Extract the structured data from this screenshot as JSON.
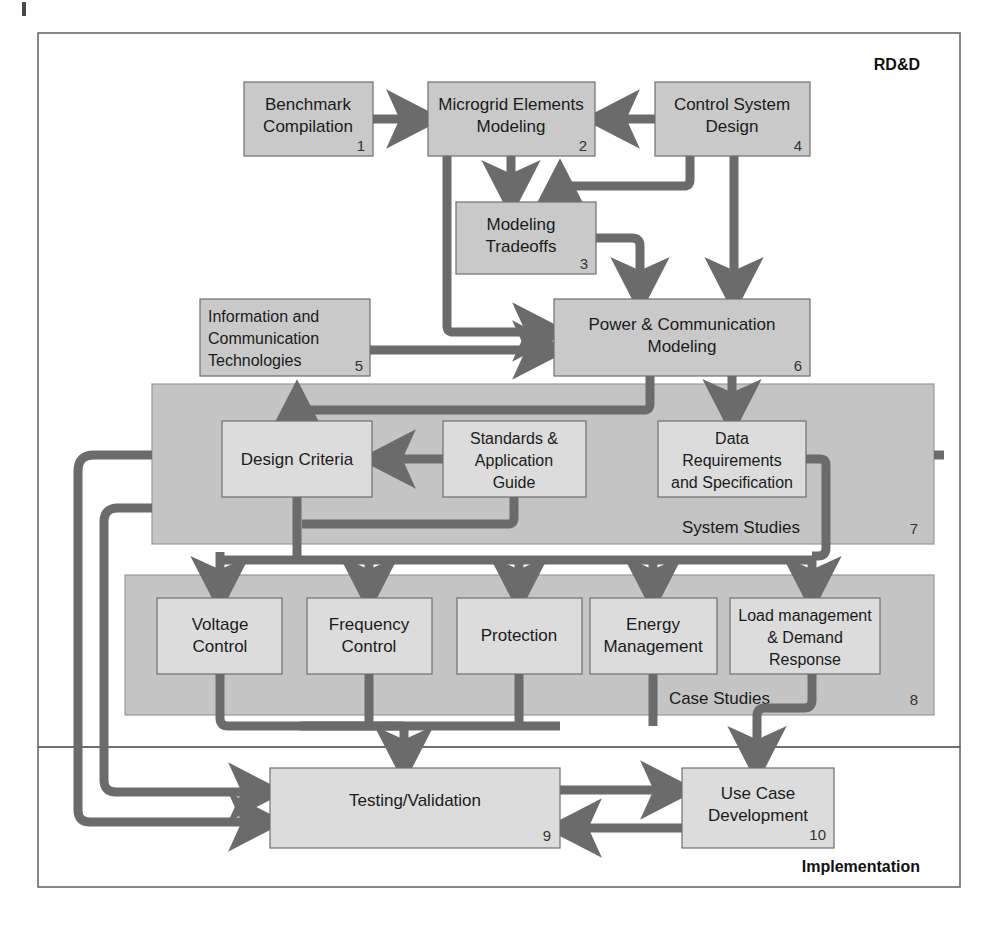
{
  "figure": {
    "caption": ""
  },
  "colors": {
    "node_fill": "#c9c9c9",
    "node_fill_light": "#dcdcdc",
    "node_stroke": "#6f6f6f",
    "group_fill": "#c4c4c4",
    "group_stroke": "#9a9a9a",
    "arrow": "#6b6b6b",
    "frame_stroke": "#6a6a6a",
    "text": "#1b1b1b",
    "page_bg": "#ffffff"
  },
  "frames": [
    {
      "id": "rdd",
      "label": "RD&D",
      "x": 38,
      "y": 33,
      "w": 922,
      "h": 714
    },
    {
      "id": "implementation",
      "label": "Implementation",
      "x": 38,
      "y": 747,
      "w": 922,
      "h": 140
    }
  ],
  "groups": [
    {
      "id": "system-studies",
      "label": "System Studies",
      "number": "7",
      "x": 152,
      "y": 384,
      "w": 782,
      "h": 160
    },
    {
      "id": "case-studies",
      "label": "Case Studies",
      "number": "8",
      "x": 125,
      "y": 575,
      "w": 809,
      "h": 140
    }
  ],
  "nodes": [
    {
      "id": "benchmark-compilation",
      "number": "1",
      "lines": [
        "Benchmark",
        "Compilation"
      ],
      "x": 244,
      "y": 82,
      "w": 129,
      "h": 74,
      "align": "center",
      "fill": "dark"
    },
    {
      "id": "microgrid-elements-modeling",
      "number": "2",
      "lines": [
        "Microgrid Elements",
        "Modeling"
      ],
      "x": 428,
      "y": 82,
      "w": 167,
      "h": 74,
      "align": "center",
      "fill": "dark"
    },
    {
      "id": "control-system-design",
      "number": "4",
      "lines": [
        "Control System",
        "Design"
      ],
      "x": 655,
      "y": 82,
      "w": 155,
      "h": 74,
      "align": "center",
      "fill": "dark"
    },
    {
      "id": "modeling-tradeoffs",
      "number": "3",
      "lines": [
        "Modeling",
        "Tradeoffs"
      ],
      "x": 456,
      "y": 202,
      "w": 140,
      "h": 72,
      "align": "center",
      "fill": "dark"
    },
    {
      "id": "information-communication-technologies",
      "number": "5",
      "lines": [
        "Information and",
        "Communication",
        "Technologies"
      ],
      "x": 200,
      "y": 299,
      "w": 170,
      "h": 77,
      "align": "left",
      "fill": "dark"
    },
    {
      "id": "power-communication-modeling",
      "number": "6",
      "lines": [
        "Power & Communication",
        "Modeling"
      ],
      "x": 554,
      "y": 299,
      "w": 256,
      "h": 77,
      "align": "center",
      "fill": "dark"
    },
    {
      "id": "design-criteria",
      "number": "",
      "lines": [
        "Design Criteria"
      ],
      "x": 222,
      "y": 421,
      "w": 150,
      "h": 76,
      "align": "center",
      "fill": "light"
    },
    {
      "id": "standards-application-guide",
      "number": "",
      "lines": [
        "Standards &",
        "Application",
        "Guide"
      ],
      "x": 443,
      "y": 421,
      "w": 143,
      "h": 76,
      "align": "center",
      "fill": "light"
    },
    {
      "id": "data-requirements-specification",
      "number": "",
      "lines": [
        "Data",
        "Requirements",
        "and Specification"
      ],
      "x": 658,
      "y": 421,
      "w": 148,
      "h": 76,
      "align": "center",
      "fill": "light"
    },
    {
      "id": "voltage-control",
      "number": "",
      "lines": [
        "Voltage",
        "Control"
      ],
      "x": 157,
      "y": 598,
      "w": 125,
      "h": 76,
      "align": "center",
      "fill": "light"
    },
    {
      "id": "frequency-control",
      "number": "",
      "lines": [
        "Frequency",
        "Control"
      ],
      "x": 307,
      "y": 598,
      "w": 125,
      "h": 76,
      "align": "center",
      "fill": "light"
    },
    {
      "id": "protection",
      "number": "",
      "lines": [
        "Protection"
      ],
      "x": 457,
      "y": 598,
      "w": 125,
      "h": 76,
      "align": "center",
      "fill": "light"
    },
    {
      "id": "energy-management",
      "number": "",
      "lines": [
        "Energy",
        "Management"
      ],
      "x": 590,
      "y": 598,
      "w": 127,
      "h": 76,
      "align": "center",
      "fill": "light"
    },
    {
      "id": "load-management-demand-response",
      "number": "",
      "lines": [
        "Load management",
        "& Demand",
        "Response"
      ],
      "x": 730,
      "y": 598,
      "w": 150,
      "h": 76,
      "align": "center",
      "fill": "light"
    },
    {
      "id": "testing-validation",
      "number": "9",
      "lines": [
        "Testing/Validation"
      ],
      "x": 270,
      "y": 768,
      "w": 290,
      "h": 80,
      "align": "center",
      "fill": "light"
    },
    {
      "id": "use-case-development",
      "number": "10",
      "lines": [
        "Use Case",
        "Development"
      ],
      "x": 682,
      "y": 768,
      "w": 152,
      "h": 80,
      "align": "center",
      "fill": "light"
    }
  ],
  "connections": [
    {
      "id": "benchmark-to-microgrid",
      "from": "benchmark-compilation",
      "to": "microgrid-elements-modeling"
    },
    {
      "id": "control-to-microgrid",
      "from": "control-system-design",
      "to": "microgrid-elements-modeling"
    },
    {
      "id": "microgrid-to-tradeoffs",
      "from": "microgrid-elements-modeling",
      "to": "modeling-tradeoffs"
    },
    {
      "id": "control-to-tradeoffs",
      "from": "control-system-design",
      "to": "modeling-tradeoffs"
    },
    {
      "id": "microgrid-to-power-modeling",
      "from": "microgrid-elements-modeling",
      "to": "power-communication-modeling"
    },
    {
      "id": "tradeoffs-to-power-modeling",
      "from": "modeling-tradeoffs",
      "to": "power-communication-modeling"
    },
    {
      "id": "control-to-power-modeling",
      "from": "control-system-design",
      "to": "power-communication-modeling"
    },
    {
      "id": "ict-to-power-modeling",
      "from": "information-communication-technologies",
      "to": "power-communication-modeling"
    },
    {
      "id": "power-modeling-to-data-requirements",
      "from": "power-communication-modeling",
      "to": "data-requirements-specification"
    },
    {
      "id": "power-modeling-to-design-criteria",
      "from": "power-communication-modeling",
      "to": "design-criteria"
    },
    {
      "id": "standards-to-design-criteria",
      "from": "standards-application-guide",
      "to": "design-criteria"
    },
    {
      "id": "design-criteria-to-case-studies",
      "from": "design-criteria",
      "to": "case-studies"
    },
    {
      "id": "data-requirements-to-load-management",
      "from": "data-requirements-specification",
      "to": "load-management-demand-response"
    },
    {
      "id": "case-studies-to-testing-validation",
      "from": "case-studies",
      "to": "testing-validation"
    },
    {
      "id": "load-management-to-use-case",
      "from": "load-management-demand-response",
      "to": "use-case-development"
    },
    {
      "id": "testing-to-use-case",
      "from": "testing-validation",
      "to": "use-case-development"
    },
    {
      "id": "use-case-to-testing",
      "from": "use-case-development",
      "to": "testing-validation"
    },
    {
      "id": "case-studies-feedback-to-testing",
      "from": "case-studies",
      "to": "testing-validation"
    },
    {
      "id": "system-studies-feedback-to-testing",
      "from": "system-studies",
      "to": "testing-validation"
    }
  ]
}
